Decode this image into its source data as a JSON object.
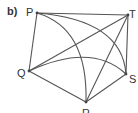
{
  "figure": {
    "part_label": "b)",
    "stroke_color": "#555555",
    "points": {
      "P": {
        "label": "P",
        "x": 37,
        "y": 13
      },
      "T": {
        "label": "T",
        "x": 128,
        "y": 15
      },
      "Q": {
        "label": "Q",
        "x": 29,
        "y": 71
      },
      "S": {
        "label": "S",
        "x": 126,
        "y": 74
      },
      "R": {
        "label": "R",
        "x": 86,
        "y": 102
      }
    },
    "segments": [
      "PT",
      "PQ",
      "QR",
      "RS",
      "ST",
      "QT",
      "RT"
    ],
    "arcs": [
      "PR",
      "PS",
      "QS"
    ]
  }
}
